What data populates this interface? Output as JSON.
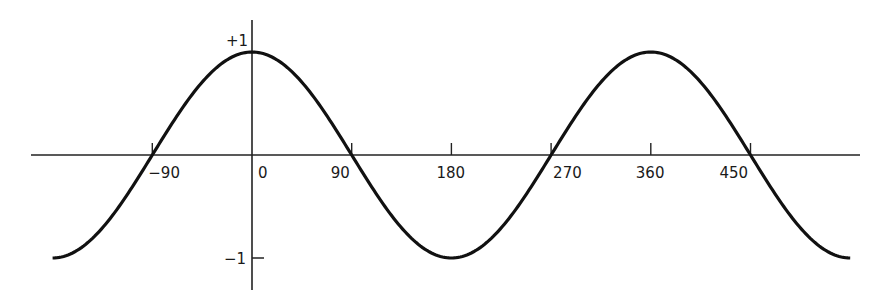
{
  "chart_data": {
    "type": "line",
    "title": "",
    "xlabel": "",
    "ylabel": "",
    "function": "cos(x), x in degrees",
    "xlim": [
      -180,
      540
    ],
    "ylim": [
      -1,
      1
    ],
    "grid": false,
    "legend": null,
    "x_ticks": [
      -90,
      0,
      90,
      180,
      270,
      360,
      450
    ],
    "x_tick_labels": [
      "−90",
      "0",
      "90",
      "180",
      "270",
      "360",
      "450"
    ],
    "y_ticks": [
      1,
      -1
    ],
    "y_tick_labels": [
      "+1",
      "−1"
    ],
    "series": [
      {
        "name": "cosine",
        "x": [
          -180,
          -135,
          -90,
          -45,
          0,
          45,
          90,
          135,
          180,
          225,
          270,
          315,
          360,
          405,
          450,
          495,
          540
        ],
        "values": [
          -1,
          -0.707,
          0,
          0.707,
          1,
          0.707,
          0,
          -0.707,
          -1,
          -0.707,
          0,
          0.707,
          1,
          0.707,
          0,
          -0.707,
          -1
        ]
      }
    ],
    "colors": {
      "curve": "#111111",
      "axes": "#222222",
      "text": "#1a1a1a"
    }
  }
}
